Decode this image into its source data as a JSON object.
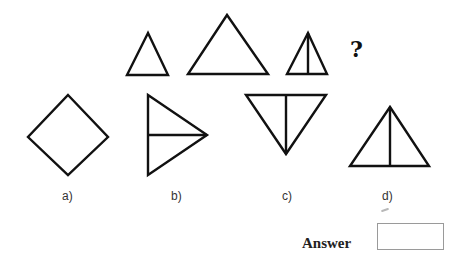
{
  "puzzle": {
    "sequence": [
      {
        "id": "seq-1",
        "description": "small triangle"
      },
      {
        "id": "seq-2",
        "description": "large triangle"
      },
      {
        "id": "seq-3",
        "description": "small triangle with vertical line"
      }
    ],
    "question_mark": "?",
    "options": [
      {
        "label": "a)",
        "description": "diamond"
      },
      {
        "label": "b)",
        "description": "right-pointing triangle with horizontal line"
      },
      {
        "label": "c)",
        "description": "inverted triangle with vertical line"
      },
      {
        "label": "d)",
        "description": "triangle with vertical line"
      }
    ]
  },
  "answer": {
    "label": "Answer",
    "value": ""
  }
}
